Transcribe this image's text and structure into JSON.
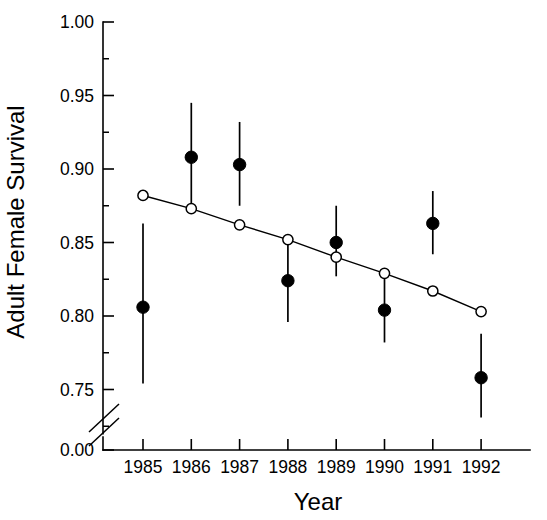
{
  "chart_data": {
    "type": "scatter",
    "title": "",
    "xlabel": "Year",
    "ylabel": "Adult Female Survival",
    "x": [
      1985,
      1986,
      1987,
      1988,
      1989,
      1990,
      1991,
      1992
    ],
    "categories": [
      "1985",
      "1986",
      "1987",
      "1988",
      "1989",
      "1990",
      "1991",
      "1992"
    ],
    "xtick_labels": [
      "1985",
      "1986",
      "1987",
      "1988",
      "1989",
      "1990",
      "1991",
      "1992"
    ],
    "ytick_labels": [
      "0.00",
      "0.75",
      "0.80",
      "0.85",
      "0.90",
      "0.95",
      "1.00"
    ],
    "ytick_values": [
      0.0,
      0.75,
      0.8,
      0.85,
      0.9,
      0.95,
      1.0
    ],
    "yminor_values": [
      0.725,
      0.775,
      0.825,
      0.875,
      0.925,
      0.975
    ],
    "ylim": [
      0.72,
      1.0
    ],
    "xlim": [
      1984.5,
      1992.5
    ],
    "axis_break": true,
    "axis_break_note": "y-axis break between 0.00 and 0.72",
    "grid": false,
    "legend": false,
    "legend_position": "none",
    "series": [
      {
        "name": "Observed adult female survival",
        "marker": "filled-circle",
        "values": [
          0.806,
          0.908,
          0.903,
          0.824,
          0.85,
          0.804,
          0.863,
          0.758
        ],
        "error_low": [
          0.754,
          0.872,
          0.875,
          0.796,
          0.827,
          0.782,
          0.842,
          0.731
        ],
        "error_high": [
          0.863,
          0.945,
          0.932,
          0.852,
          0.875,
          0.829,
          0.885,
          0.788
        ]
      },
      {
        "name": "Fitted trend",
        "marker": "open-circle",
        "line": true,
        "values": [
          0.882,
          0.873,
          0.862,
          0.852,
          0.84,
          0.829,
          0.817,
          0.803
        ]
      }
    ]
  },
  "colors": {
    "foreground": "#000000",
    "background": "#ffffff"
  }
}
